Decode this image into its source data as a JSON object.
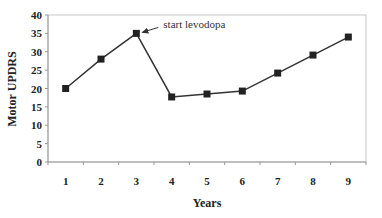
{
  "chart_data": {
    "type": "line",
    "title": "",
    "xlabel": "Years",
    "ylabel": "Motor UPDRS",
    "categories": [
      "1",
      "2",
      "3",
      "4",
      "5",
      "6",
      "7",
      "8",
      "9"
    ],
    "series": [
      {
        "name": "Motor UPDRS",
        "values": [
          20,
          28,
          35,
          17.7,
          18.5,
          19.3,
          24.2,
          29.1,
          34
        ]
      }
    ],
    "ylim": [
      0,
      40
    ],
    "yticks": [
      0,
      5,
      10,
      15,
      20,
      25,
      30,
      35,
      40
    ],
    "grid": false,
    "legend": "none",
    "annotations": [
      {
        "text": "start levodopa",
        "category": "3",
        "value": 35,
        "arrow": true
      }
    ],
    "colors": {
      "line": "#333333",
      "marker": "#222222",
      "axis": "#999999"
    }
  }
}
